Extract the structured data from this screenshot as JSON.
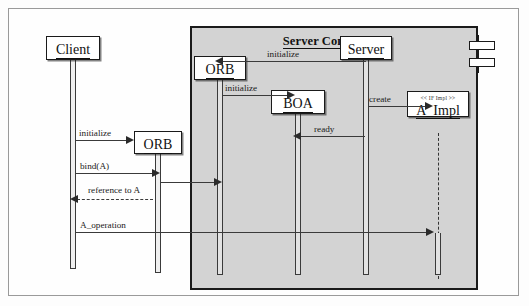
{
  "diagram": {
    "type": "uml-sequence-diagram",
    "component": {
      "title": "Server Component",
      "icon": "component-icon",
      "fill_color": "#d3d3d3",
      "border_color": "#1a1a1a"
    },
    "background_color": "#fefefe",
    "frame_color": "#9a9a9a"
  },
  "objects": [
    {
      "id": "client",
      "label": "Client",
      "stereotype": "",
      "inside_component": false
    },
    {
      "id": "client_orb",
      "label": "ORB",
      "stereotype": "",
      "inside_component": false
    },
    {
      "id": "server_orb",
      "label": "ORB",
      "stereotype": "",
      "inside_component": true
    },
    {
      "id": "boa",
      "label": "BOA",
      "stereotype": "",
      "inside_component": true
    },
    {
      "id": "server",
      "label": "Server",
      "stereotype": "",
      "inside_component": true
    },
    {
      "id": "a_impl",
      "label": "A_Impl",
      "stereotype": "<< IF Impl >>",
      "inside_component": true
    }
  ],
  "messages": [
    {
      "id": "m1",
      "label": "initialize",
      "from": "server",
      "to": "server_orb",
      "style": "solid",
      "direction": "left"
    },
    {
      "id": "m2",
      "label": "initialize",
      "from": "server_orb",
      "to": "boa",
      "style": "solid",
      "direction": "right"
    },
    {
      "id": "m3",
      "label": "create",
      "from": "server",
      "to": "a_impl",
      "style": "solid",
      "direction": "right"
    },
    {
      "id": "m4",
      "label": "ready",
      "from": "server",
      "to": "boa",
      "style": "solid",
      "direction": "left"
    },
    {
      "id": "m5",
      "label": "initialize",
      "from": "client",
      "to": "client_orb",
      "style": "solid",
      "direction": "right"
    },
    {
      "id": "m6",
      "label": "bind(A)",
      "from": "client",
      "to": "client_orb",
      "style": "solid",
      "direction": "right"
    },
    {
      "id": "m7",
      "label": "bind(A)-fwd",
      "from": "client_orb",
      "to": "server_orb",
      "style": "solid",
      "direction": "right"
    },
    {
      "id": "m8",
      "label": "reference to A",
      "from": "client_orb",
      "to": "client",
      "style": "dashed",
      "direction": "left"
    },
    {
      "id": "m9",
      "label": "A_operation",
      "from": "client",
      "to": "a_impl",
      "style": "solid",
      "direction": "right"
    }
  ]
}
